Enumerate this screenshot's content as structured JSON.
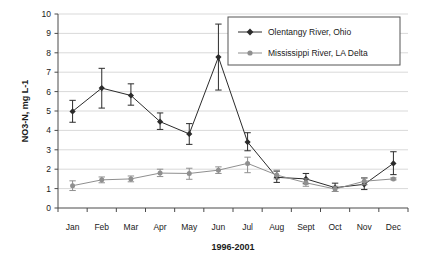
{
  "chart_data": {
    "type": "line",
    "title": "",
    "xlabel": "1996-2001",
    "ylabel": "NO3-N, mg L-1",
    "categories": [
      "Jan",
      "Feb",
      "Mar",
      "Apr",
      "May",
      "Jun",
      "Jul",
      "Aug",
      "Sept",
      "Oct",
      "Nov",
      "Dec"
    ],
    "ylim": [
      0,
      10
    ],
    "yticks": [
      "0",
      "1",
      "2",
      "3",
      "4",
      "5",
      "6",
      "7",
      "8",
      "9",
      "10"
    ],
    "grid": true,
    "legend_position": "top-right",
    "series": [
      {
        "name": "Olentangy River, Ohio",
        "color": "#2b2b2b",
        "marker": "diamond",
        "values": [
          4.98,
          6.18,
          5.8,
          4.45,
          3.82,
          7.78,
          3.4,
          1.58,
          1.5,
          1.05,
          1.22,
          2.3
        ],
        "err_low": [
          4.42,
          5.15,
          5.3,
          4.05,
          3.28,
          6.08,
          2.95,
          1.32,
          1.25,
          0.85,
          0.95,
          1.72
        ],
        "err_high": [
          5.55,
          7.2,
          6.4,
          4.9,
          4.35,
          9.48,
          3.88,
          1.9,
          1.78,
          1.28,
          1.55,
          2.9
        ]
      },
      {
        "name": "Mississippi River, LA Delta",
        "color": "#8f8f8f",
        "marker": "circle",
        "values": [
          1.15,
          1.45,
          1.5,
          1.8,
          1.78,
          1.95,
          2.3,
          1.7,
          1.3,
          0.98,
          1.38,
          1.5
        ],
        "err_low": [
          0.9,
          1.3,
          1.35,
          1.62,
          1.48,
          1.78,
          1.82,
          1.5,
          1.12,
          0.85,
          1.2,
          1.45
        ],
        "err_high": [
          1.4,
          1.6,
          1.65,
          2.0,
          2.05,
          2.12,
          2.62,
          1.95,
          1.5,
          1.12,
          1.55,
          1.55
        ]
      }
    ]
  },
  "legend": {
    "items": [
      {
        "label": "Olentangy River, Ohio"
      },
      {
        "label": "Mississippi River, LA Delta"
      }
    ]
  },
  "colors": {
    "olentangy": "#2b2b2b",
    "mississippi": "#8f8f8f",
    "grid": "#d9d9d9",
    "axis": "#4a4a4a",
    "text": "#1a1a1a"
  }
}
